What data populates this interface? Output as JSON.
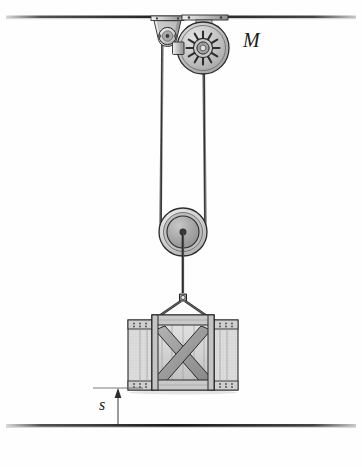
{
  "figure": {
    "background_color": "#fefefe"
  },
  "labels": {
    "motor": "M",
    "distance": "s"
  },
  "components": {
    "ceiling": {
      "name": "ceiling-line",
      "color": "#2b2b2b"
    },
    "ground": {
      "name": "ground-line",
      "color": "#2b2b2b"
    },
    "motor": {
      "name": "motor-pulley",
      "center_x": 203,
      "center_y": 48,
      "outer_radius": 26,
      "spoke_count": 12,
      "body_color": "#b8b8b8",
      "rim_color": "#d2d2d2",
      "outline_color": "#2b2b2b"
    },
    "idler_pulley": {
      "name": "idler-pulley",
      "center_x": 167,
      "center_y": 36,
      "radius": 9,
      "bracket_color": "#c8c8c8"
    },
    "lower_pulley": {
      "name": "lower-pulley",
      "center_x": 183,
      "center_y": 232,
      "outer_radius": 24,
      "inner_radius": 16,
      "hub_radius": 3,
      "body_color": "#9a9a9a",
      "rim_color": "#d0d0d0",
      "outline_color": "#2b2b2b"
    },
    "crate": {
      "name": "crate",
      "left": 128,
      "top": 315,
      "width": 110,
      "height": 76,
      "panel_color": "#d8d8d8",
      "slat_color": "#c0c0c0",
      "brace_color": "#9b9b9b",
      "outline_color": "#2b2b2b"
    },
    "rope": {
      "name": "rope",
      "color": "#3a3a3a"
    },
    "sling": {
      "name": "sling-rigging",
      "color": "#3a3a3a"
    },
    "dimension": {
      "name": "distance-dimension",
      "x": 118,
      "top_y": 388,
      "bottom_y": 425,
      "color": "#4a4a4a"
    }
  },
  "colors": {
    "ink": "#2b2b2b",
    "metal_light": "#d8d8d8",
    "metal_mid": "#b0b0b0",
    "metal_dark": "#8a8a8a",
    "wood_light": "#dcdcdc",
    "wood_mid": "#c2c2c2",
    "wood_dark": "#9b9b9b"
  }
}
